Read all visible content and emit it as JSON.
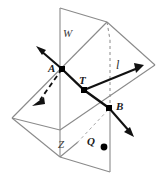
{
  "diagram": {
    "canvas": {
      "width": 161,
      "height": 175,
      "background": "#ffffff"
    },
    "stroke_colors": {
      "plane_outline": "#8a8a8a",
      "line_solid": "#111111",
      "line_dashed": "#111111",
      "point_fill": "#000000",
      "label_text": "#1a1a1a"
    },
    "planes": [
      {
        "name": "W",
        "label": "W",
        "label_x": 63,
        "label_y": 28,
        "orientation": "vertical",
        "outline_points": "60,8 110,40 110,172 60,157"
      },
      {
        "name": "Z",
        "label": "Z",
        "label_x": 58,
        "label_y": 139,
        "orientation": "slanted",
        "outline_points": "107,22 155,65 60,130 12,118"
      }
    ],
    "line": {
      "name": "l",
      "label": "l",
      "label_x": 116,
      "label_y": 59,
      "description": "line through A, T and B"
    },
    "points": [
      {
        "label": "A",
        "x": 62,
        "y": 69,
        "marker": "square",
        "label_x": 49,
        "label_y": 63
      },
      {
        "label": "T",
        "x": 84,
        "y": 90,
        "marker": "square",
        "label_x": 79,
        "label_y": 75
      },
      {
        "label": "B",
        "x": 109,
        "y": 108,
        "marker": "square",
        "label_x": 116,
        "label_y": 102
      },
      {
        "label": "Q",
        "x": 104,
        "y": 147,
        "marker": "dot",
        "label_x": 87,
        "label_y": 137
      }
    ],
    "arrows": [
      {
        "name": "upper-left-arrow",
        "from": "A",
        "direction": "up-left",
        "style": "solid"
      },
      {
        "name": "upper-right-arrow",
        "from": "T",
        "direction": "up-right",
        "style": "solid"
      },
      {
        "name": "lower-right-arrow",
        "from": "B",
        "direction": "down-right",
        "style": "solid"
      },
      {
        "name": "lower-left-dashed-arrow",
        "from": "A",
        "direction": "down-left",
        "style": "dashed"
      }
    ]
  }
}
